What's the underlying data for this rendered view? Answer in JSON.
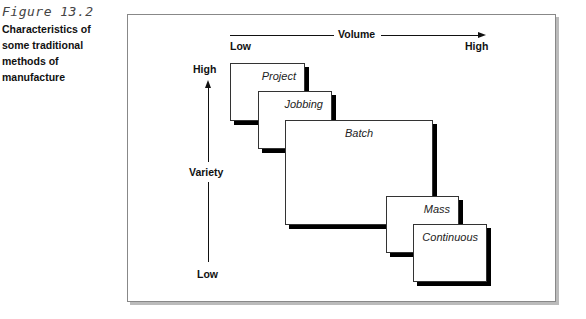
{
  "caption": {
    "figure_number": "Figure 13.2",
    "title": "Characteristics of some traditional methods of manufacture"
  },
  "axes": {
    "x": {
      "label": "Volume",
      "low": "Low",
      "high": "High"
    },
    "y": {
      "label": "Variety",
      "low": "Low",
      "high": "High"
    }
  },
  "boxes": [
    {
      "label": "Project"
    },
    {
      "label": "Jobbing"
    },
    {
      "label": "Batch"
    },
    {
      "label": "Mass"
    },
    {
      "label": "Continuous"
    }
  ]
}
